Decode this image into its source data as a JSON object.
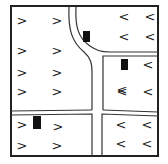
{
  "diagram": {
    "title": "",
    "frame": {
      "x": 11,
      "y": 6,
      "w": 147,
      "h": 150,
      "stroke": "#222222"
    },
    "arrows": [
      {
        "glyph": ">",
        "direction": "right",
        "x": 22,
        "y": 20
      },
      {
        "glyph": ">",
        "direction": "right",
        "x": 57,
        "y": 20
      },
      {
        "glyph": ">",
        "direction": "right",
        "x": 22,
        "y": 50
      },
      {
        "glyph": ">",
        "direction": "right",
        "x": 57,
        "y": 50
      },
      {
        "glyph": ">",
        "direction": "right",
        "x": 22,
        "y": 72
      },
      {
        "glyph": ">",
        "direction": "right",
        "x": 57,
        "y": 72
      },
      {
        "glyph": ">",
        "direction": "right",
        "x": 22,
        "y": 91
      },
      {
        "glyph": ">",
        "direction": "right",
        "x": 57,
        "y": 91
      },
      {
        "glyph": ">",
        "direction": "right",
        "x": 22,
        "y": 124
      },
      {
        "glyph": ">",
        "direction": "right",
        "x": 58,
        "y": 126
      },
      {
        "glyph": ">",
        "direction": "right",
        "x": 22,
        "y": 145
      },
      {
        "glyph": ">",
        "direction": "right",
        "x": 57,
        "y": 145
      },
      {
        "glyph": "<",
        "direction": "left",
        "x": 124,
        "y": 16
      },
      {
        "glyph": "<",
        "direction": "left",
        "x": 150,
        "y": 16
      },
      {
        "glyph": "<",
        "direction": "left",
        "x": 124,
        "y": 36
      },
      {
        "glyph": "<",
        "direction": "left",
        "x": 150,
        "y": 36
      },
      {
        "glyph": "<",
        "direction": "left",
        "x": 148,
        "y": 64
      },
      {
        "glyph": "<",
        "direction": "left",
        "x": 122,
        "y": 91
      },
      {
        "glyph": "<",
        "direction": "left",
        "x": 148,
        "y": 91
      },
      {
        "glyph": "<",
        "direction": "left",
        "x": 122,
        "y": 89
      },
      {
        "glyph": "<",
        "direction": "left",
        "x": 121,
        "y": 124
      },
      {
        "glyph": "<",
        "direction": "left",
        "x": 147,
        "y": 124
      },
      {
        "glyph": "<",
        "direction": "left",
        "x": 121,
        "y": 143
      },
      {
        "glyph": "<",
        "direction": "left",
        "x": 147,
        "y": 143
      }
    ],
    "markers": [
      {
        "label": "block-marker",
        "x": 83,
        "y": 31,
        "w": 7,
        "h": 11
      },
      {
        "label": "block-marker",
        "x": 121,
        "y": 59,
        "w": 7,
        "h": 11
      },
      {
        "label": "block-marker",
        "x": 33,
        "y": 116,
        "w": 8,
        "h": 13
      }
    ]
  }
}
